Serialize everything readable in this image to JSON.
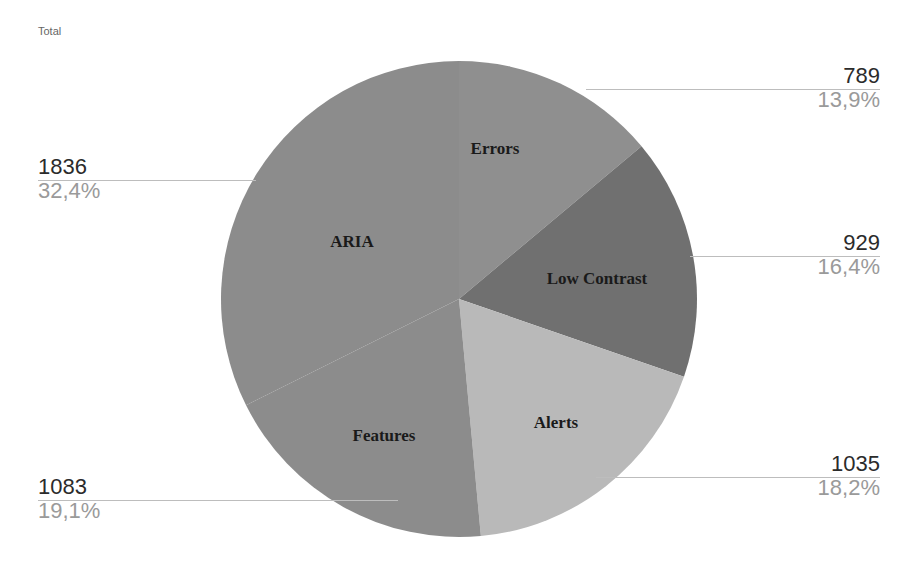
{
  "chart_data": {
    "type": "pie",
    "title": "Total",
    "categories": [
      "Errors",
      "Low Contrast",
      "Alerts",
      "Features",
      "ARIA"
    ],
    "values": [
      789,
      929,
      1035,
      1083,
      1836
    ],
    "percentages": [
      "13,9%",
      "16,4%",
      "18,2%",
      "19,1%",
      "32,4%"
    ],
    "colors": [
      "#8f8f8f",
      "#707070",
      "#b9b9b9",
      "#8c8c8c",
      "#8c8c8c"
    ],
    "start_angle": "12 o'clock, clockwise",
    "legend": "none (inline slice labels with value/percent callouts)"
  },
  "title": "Total",
  "callouts": {
    "errors": {
      "value": "789",
      "percent": "13,9%"
    },
    "low_contrast": {
      "value": "929",
      "percent": "16,4%"
    },
    "alerts": {
      "value": "1035",
      "percent": "18,2%"
    },
    "features": {
      "value": "1083",
      "percent": "19,1%"
    },
    "aria": {
      "value": "1836",
      "percent": "32,4%"
    }
  },
  "labels": {
    "errors": "Errors",
    "low_contrast": "Low Contrast",
    "alerts": "Alerts",
    "features": "Features",
    "aria": "ARIA"
  }
}
